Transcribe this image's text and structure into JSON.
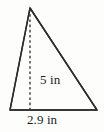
{
  "figure": {
    "kind": "geometry-diagram",
    "shape": "triangle",
    "background_color": "#fdfdfc",
    "stroke_color": "#2b2b2b",
    "text_color": "#1d1d1d",
    "labels": {
      "slant_side": "5 in",
      "base": "2.9 in"
    },
    "vertices": {
      "apex": {
        "x": 30,
        "y": 8
      },
      "bottom_left": {
        "x": 10,
        "y": 110
      },
      "bottom_right": {
        "x": 97,
        "y": 110
      }
    },
    "height_line": {
      "style": "dashed",
      "from": {
        "x": 30,
        "y": 8
      },
      "to": {
        "x": 30,
        "y": 110
      }
    },
    "measurements": [
      {
        "name": "slant-side-length",
        "value": "5 in",
        "number": 5,
        "unit": "in"
      },
      {
        "name": "base-length",
        "value": "2.9 in",
        "number": 2.9,
        "unit": "in"
      }
    ]
  }
}
